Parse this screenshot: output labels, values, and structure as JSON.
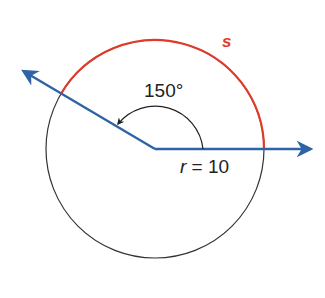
{
  "diagram": {
    "type": "circle-sector-arc-length",
    "labels": {
      "arc": "s",
      "angle": "150°",
      "radius_var": "r",
      "radius_eq": " = 10"
    },
    "values": {
      "central_angle_deg": 150,
      "radius": 10
    },
    "colors": {
      "ray": "#2e63a6",
      "arc": "#e03b2a",
      "circle": "#333333",
      "text": "#222222"
    }
  }
}
